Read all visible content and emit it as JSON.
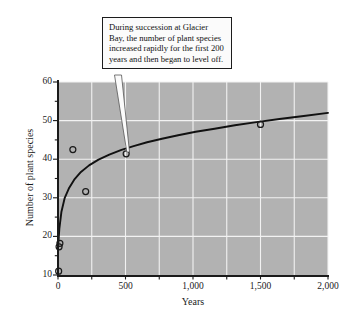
{
  "figure": {
    "annotation": "During succession at Glacier Bay, the number of plant species increased rapidly for the first 200 years and then began to level off."
  },
  "chart_data": {
    "type": "scatter",
    "title": "",
    "xlabel": "Years",
    "ylabel": "Number of plant species",
    "xlim": [
      0,
      2000
    ],
    "ylim": [
      10,
      60
    ],
    "grid": true,
    "legend": "none",
    "xticks": [
      0,
      500,
      1000,
      1500,
      2000
    ],
    "xtick_labels": [
      "0",
      "500",
      "1,000",
      "1,500",
      "2,000"
    ],
    "x_minor_tick_step": 250,
    "yticks": [
      10,
      20,
      30,
      40,
      50,
      60
    ],
    "ytick_labels": [
      "10",
      "20",
      "30",
      "40",
      "50",
      "60"
    ],
    "y_minor_tick_step": 5,
    "points": [
      {
        "x": 5,
        "y": 11
      },
      {
        "x": 8,
        "y": 17.3
      },
      {
        "x": 14,
        "y": 18.2
      },
      {
        "x": 110,
        "y": 42.5
      },
      {
        "x": 205,
        "y": 31.6
      },
      {
        "x": 505,
        "y": 41.4
      },
      {
        "x": 1500,
        "y": 49.0
      }
    ],
    "curve": {
      "label": "fitted logarithmic trend",
      "x": [
        0,
        10,
        25,
        50,
        80,
        120,
        170,
        230,
        300,
        380,
        470,
        560,
        660,
        770,
        890,
        1020,
        1160,
        1310,
        1470,
        1640,
        1820,
        2000
      ],
      "y": [
        17.0,
        22.0,
        26.3,
        30.0,
        32.4,
        34.7,
        36.7,
        38.4,
        39.9,
        41.2,
        42.4,
        43.4,
        44.4,
        45.3,
        46.2,
        47.1,
        47.9,
        48.8,
        49.6,
        50.4,
        51.2,
        52.0
      ]
    },
    "colors": {
      "plot_background": "#b2b2b2",
      "gridline": "#f2f2f2",
      "curve": "#111111",
      "marker_edge": "#1a1a1a",
      "axis": "#1a1a1a",
      "callout_background": "#fbfbfb",
      "callout_border": "#1c1c1c"
    }
  }
}
